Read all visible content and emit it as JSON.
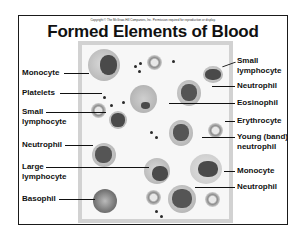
{
  "slide": {
    "copyright": "Copyright © The McGraw-Hill Companies, Inc. Permission required for reproduction or display.",
    "title": "Formed Elements of Blood"
  },
  "labels_left": [
    {
      "text": "Monocyte"
    },
    {
      "text": "Platelets"
    },
    {
      "text": "Small\nlymphocyte",
      "line1": "Small",
      "line2": "lymphocyte"
    },
    {
      "text": "Neutrophil"
    },
    {
      "text": "Large\nlymphocyte",
      "line1": "Large",
      "line2": "lymphocyte"
    },
    {
      "text": "Basophil"
    }
  ],
  "labels_right": [
    {
      "text": "Small\nlymphocyte",
      "line1": "Small",
      "line2": "lymphocyte"
    },
    {
      "text": "Neutrophil"
    },
    {
      "text": "Eosinophil"
    },
    {
      "text": "Erythrocyte"
    },
    {
      "text": "Young (band)\nneutrophil",
      "line1": "Young (band)",
      "line2": "neutrophil"
    },
    {
      "text": "Monocyte"
    },
    {
      "text": "Neutrophil"
    }
  ],
  "colors": {
    "frame_border": "#1a1a1a",
    "panel_border": "#d2d2d2",
    "text": "#111111"
  }
}
